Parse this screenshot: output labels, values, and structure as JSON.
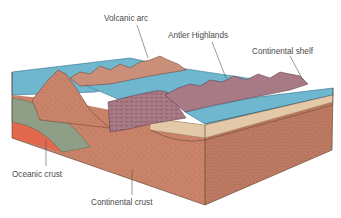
{
  "diagram": {
    "type": "geologic-block-diagram",
    "labels": {
      "volcanic_arc": "Volcanic arc",
      "antler_highlands": "Antler Highlands",
      "continental_shelf": "Continental shelf",
      "oceanic_crust": "Oceanic crust",
      "continental_crust": "Continental crust"
    },
    "colors": {
      "ocean_water": "#6fb6cf",
      "ocean_water_dark": "#4f9bb8",
      "continental_crust": "#c9846a",
      "crust_speckle": "#8a4a3a",
      "oceanic_crust": "#8f9e86",
      "mantle_red": "#e2694e",
      "highlands": "#a87a86",
      "volcanic_arc": "#c98f78",
      "sediment": "#e3c9a8",
      "background": "#ffffff"
    }
  }
}
